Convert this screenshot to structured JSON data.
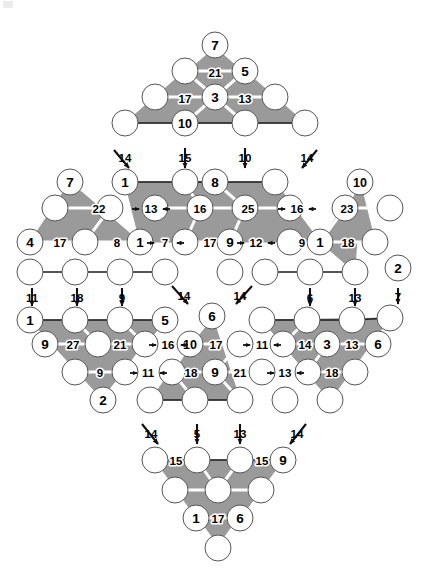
{
  "figure": {
    "colors": {
      "fill_shaded": "#9a9a9a",
      "fill_node": "#ffffff",
      "stroke": "#1a1a1a",
      "inner_edge": "#ffffff",
      "background": "#ffffff"
    },
    "geometry": {
      "cell_dx": 30,
      "cell_dy": 26,
      "node_radius": 13,
      "origin_x": 215,
      "origin_y": 45
    }
  },
  "chart_data": {
    "type": "diagram",
    "node_count": 66,
    "triangles": [
      {
        "name": "top-up",
        "apex_row": 0,
        "size": 4,
        "orientation": "up"
      },
      {
        "name": "left-up",
        "apex_row": 5,
        "size": 4,
        "orientation": "up"
      },
      {
        "name": "right-up",
        "apex_row": 5,
        "size": 4,
        "orientation": "up"
      },
      {
        "name": "center-down",
        "apex_row": 9,
        "size": 4,
        "orientation": "down"
      },
      {
        "name": "bottom-down",
        "apex_row": 16,
        "size": 4,
        "orientation": "down"
      }
    ]
  },
  "nodes": [
    {
      "id": "n-top-7",
      "label": "7",
      "x": 215,
      "y": 45
    },
    {
      "id": "n-r1-a",
      "label": "",
      "x": 185,
      "y": 71
    },
    {
      "id": "n-r1-5",
      "label": "5",
      "x": 245,
      "y": 71
    },
    {
      "id": "n-r2-a",
      "label": "",
      "x": 155,
      "y": 97
    },
    {
      "id": "n-r2-3",
      "label": "3",
      "x": 215,
      "y": 97
    },
    {
      "id": "n-r2-b",
      "label": "",
      "x": 275,
      "y": 97
    },
    {
      "id": "n-r3-a",
      "label": "",
      "x": 125,
      "y": 123
    },
    {
      "id": "n-r3-10",
      "label": "10",
      "x": 185,
      "y": 123
    },
    {
      "id": "n-r3-b",
      "label": "",
      "x": 245,
      "y": 123
    },
    {
      "id": "n-r3-c",
      "label": "",
      "x": 305,
      "y": 123
    },
    {
      "id": "n-r4-7",
      "label": "7",
      "x": 70,
      "y": 182
    },
    {
      "id": "n-r4-1",
      "label": "1",
      "x": 125,
      "y": 182
    },
    {
      "id": "n-r4-a",
      "label": "",
      "x": 185,
      "y": 182
    },
    {
      "id": "n-r4-8",
      "label": "8",
      "x": 215,
      "y": 182
    },
    {
      "id": "n-r4-b",
      "label": "",
      "x": 275,
      "y": 182
    },
    {
      "id": "n-r4-10",
      "label": "10",
      "x": 360,
      "y": 182
    },
    {
      "id": "n-r5-a",
      "label": "",
      "x": 55,
      "y": 208
    },
    {
      "id": "n-r5-b",
      "label": "",
      "x": 110,
      "y": 208
    },
    {
      "id": "n-r5-c",
      "label": "",
      "x": 155,
      "y": 208
    },
    {
      "id": "n-r5-d",
      "label": "",
      "x": 200,
      "y": 208
    },
    {
      "id": "n-r5-e",
      "label": "",
      "x": 245,
      "y": 208
    },
    {
      "id": "n-r5-f",
      "label": "",
      "x": 290,
      "y": 208
    },
    {
      "id": "n-r5-g",
      "label": "",
      "x": 345,
      "y": 208
    },
    {
      "id": "n-r5-h",
      "label": "",
      "x": 390,
      "y": 208
    },
    {
      "id": "n-r6-4",
      "label": "4",
      "x": 30,
      "y": 242
    },
    {
      "id": "n-r6-a",
      "label": "",
      "x": 85,
      "y": 242
    },
    {
      "id": "n-r6-1",
      "label": "1",
      "x": 140,
      "y": 242
    },
    {
      "id": "n-r6-b",
      "label": "",
      "x": 185,
      "y": 242
    },
    {
      "id": "n-r6-9",
      "label": "9",
      "x": 230,
      "y": 242
    },
    {
      "id": "n-r6-c",
      "label": "",
      "x": 290,
      "y": 242
    },
    {
      "id": "n-r6-1b",
      "label": "1",
      "x": 320,
      "y": 242
    },
    {
      "id": "n-r6-d",
      "label": "",
      "x": 375,
      "y": 242
    },
    {
      "id": "n-r7-a",
      "label": "",
      "x": 30,
      "y": 272
    },
    {
      "id": "n-r7-b",
      "label": "",
      "x": 75,
      "y": 272
    },
    {
      "id": "n-r7-c",
      "label": "",
      "x": 120,
      "y": 272
    },
    {
      "id": "n-r7-d",
      "label": "",
      "x": 165,
      "y": 272
    },
    {
      "id": "n-r7-e",
      "label": "",
      "x": 230,
      "y": 272
    },
    {
      "id": "n-r7-f",
      "label": "",
      "x": 265,
      "y": 272
    },
    {
      "id": "n-r7-g",
      "label": "",
      "x": 310,
      "y": 272
    },
    {
      "id": "n-r7-h",
      "label": "",
      "x": 355,
      "y": 272
    },
    {
      "id": "n-r7-2",
      "label": "2",
      "x": 398,
      "y": 268
    },
    {
      "id": "n-r8-1",
      "label": "1",
      "x": 30,
      "y": 320
    },
    {
      "id": "n-r8-a",
      "label": "",
      "x": 75,
      "y": 320
    },
    {
      "id": "n-r8-b",
      "label": "",
      "x": 120,
      "y": 320
    },
    {
      "id": "n-r8-5",
      "label": "5",
      "x": 165,
      "y": 320
    },
    {
      "id": "n-r8-6",
      "label": "6",
      "x": 212,
      "y": 316
    },
    {
      "id": "n-r8-c",
      "label": "",
      "x": 262,
      "y": 320
    },
    {
      "id": "n-r8-d",
      "label": "",
      "x": 307,
      "y": 320
    },
    {
      "id": "n-r8-e",
      "label": "",
      "x": 352,
      "y": 320
    },
    {
      "id": "n-r8-f",
      "label": "",
      "x": 390,
      "y": 318
    },
    {
      "id": "n-r9-9",
      "label": "9",
      "x": 45,
      "y": 344
    },
    {
      "id": "n-r9-a",
      "label": "",
      "x": 98,
      "y": 344
    },
    {
      "id": "n-r9-b",
      "label": "",
      "x": 145,
      "y": 344
    },
    {
      "id": "n-r9-10",
      "label": "10",
      "x": 190,
      "y": 344
    },
    {
      "id": "n-r9-c",
      "label": "",
      "x": 240,
      "y": 344
    },
    {
      "id": "n-r9-d",
      "label": "",
      "x": 283,
      "y": 344
    },
    {
      "id": "n-r9-3",
      "label": "3",
      "x": 327,
      "y": 344
    },
    {
      "id": "n-r9-6",
      "label": "6",
      "x": 378,
      "y": 344
    },
    {
      "id": "n-r10-a",
      "label": "",
      "x": 75,
      "y": 372
    },
    {
      "id": "n-r10-b",
      "label": "",
      "x": 125,
      "y": 372
    },
    {
      "id": "n-r10-c",
      "label": "",
      "x": 172,
      "y": 372
    },
    {
      "id": "n-r10-9",
      "label": "9",
      "x": 215,
      "y": 372
    },
    {
      "id": "n-r10-d",
      "label": "",
      "x": 262,
      "y": 372
    },
    {
      "id": "n-r10-e",
      "label": "",
      "x": 308,
      "y": 372
    },
    {
      "id": "n-r10-f",
      "label": "",
      "x": 355,
      "y": 372
    },
    {
      "id": "n-r11-2",
      "label": "2",
      "x": 103,
      "y": 400
    },
    {
      "id": "n-r11-a",
      "label": "",
      "x": 150,
      "y": 400
    },
    {
      "id": "n-r11-b",
      "label": "",
      "x": 195,
      "y": 400
    },
    {
      "id": "n-r11-c",
      "label": "",
      "x": 240,
      "y": 400
    },
    {
      "id": "n-r11-d",
      "label": "",
      "x": 285,
      "y": 400
    },
    {
      "id": "n-r11-e",
      "label": "",
      "x": 330,
      "y": 400
    },
    {
      "id": "n-r12-a",
      "label": "",
      "x": 155,
      "y": 460
    },
    {
      "id": "n-r12-b",
      "label": "",
      "x": 197,
      "y": 460
    },
    {
      "id": "n-r12-c",
      "label": "",
      "x": 240,
      "y": 460
    },
    {
      "id": "n-r12-9",
      "label": "9",
      "x": 283,
      "y": 460
    },
    {
      "id": "n-r13-a",
      "label": "",
      "x": 175,
      "y": 490
    },
    {
      "id": "n-r13-b",
      "label": "",
      "x": 218,
      "y": 490
    },
    {
      "id": "n-r13-c",
      "label": "",
      "x": 261,
      "y": 490
    },
    {
      "id": "n-r14-1",
      "label": "1",
      "x": 196,
      "y": 518
    },
    {
      "id": "n-r14-6",
      "label": "6",
      "x": 240,
      "y": 518
    },
    {
      "id": "n-r15-a",
      "label": "",
      "x": 218,
      "y": 548
    }
  ],
  "edge_labels": [
    {
      "id": "e-21",
      "text": "21",
      "x": 215,
      "y": 73
    },
    {
      "id": "e-17",
      "text": "17",
      "x": 185,
      "y": 99
    },
    {
      "id": "e-13",
      "text": "13",
      "x": 245,
      "y": 99
    },
    {
      "id": "e-22",
      "text": "22",
      "x": 99,
      "y": 209
    },
    {
      "id": "e-13b",
      "text": "13",
      "x": 151,
      "y": 209
    },
    {
      "id": "e-16",
      "text": "16",
      "x": 200,
      "y": 209
    },
    {
      "id": "e-25",
      "text": "25",
      "x": 248,
      "y": 209
    },
    {
      "id": "e-16b",
      "text": "16",
      "x": 297,
      "y": 209
    },
    {
      "id": "e-23",
      "text": "23",
      "x": 347,
      "y": 209
    },
    {
      "id": "e-17b",
      "text": "17",
      "x": 60,
      "y": 243
    },
    {
      "id": "e-8",
      "text": "8",
      "x": 117,
      "y": 243
    },
    {
      "id": "e-7",
      "text": "7",
      "x": 165,
      "y": 243
    },
    {
      "id": "e-17c",
      "text": "17",
      "x": 210,
      "y": 243
    },
    {
      "id": "e-12",
      "text": "12",
      "x": 256,
      "y": 243
    },
    {
      "id": "e-9",
      "text": "9",
      "x": 302,
      "y": 243
    },
    {
      "id": "e-18",
      "text": "18",
      "x": 348,
      "y": 243
    },
    {
      "id": "e-27",
      "text": "27",
      "x": 73,
      "y": 345
    },
    {
      "id": "e-21b",
      "text": "21",
      "x": 120,
      "y": 345
    },
    {
      "id": "e-16c",
      "text": "16",
      "x": 168,
      "y": 345
    },
    {
      "id": "e-17d",
      "text": "17",
      "x": 216,
      "y": 345
    },
    {
      "id": "e-11",
      "text": "11",
      "x": 262,
      "y": 345
    },
    {
      "id": "e-14",
      "text": "14",
      "x": 305,
      "y": 345
    },
    {
      "id": "e-13c",
      "text": "13",
      "x": 352,
      "y": 345
    },
    {
      "id": "e-9b",
      "text": "9",
      "x": 100,
      "y": 373
    },
    {
      "id": "e-11b",
      "text": "11",
      "x": 148,
      "y": 373
    },
    {
      "id": "e-18b",
      "text": "18",
      "x": 191,
      "y": 373
    },
    {
      "id": "e-21c",
      "text": "21",
      "x": 240,
      "y": 373
    },
    {
      "id": "e-13d",
      "text": "13",
      "x": 285,
      "y": 373
    },
    {
      "id": "e-18c",
      "text": "18",
      "x": 332,
      "y": 373
    },
    {
      "id": "e-15",
      "text": "15",
      "x": 176,
      "y": 461
    },
    {
      "id": "e-15b",
      "text": "15",
      "x": 262,
      "y": 461
    },
    {
      "id": "e-17e",
      "text": "17",
      "x": 218,
      "y": 519
    }
  ],
  "external_labels": [
    {
      "id": "x-14a",
      "text": "14",
      "x": 125,
      "y": 158
    },
    {
      "id": "x-15a",
      "text": "15",
      "x": 185,
      "y": 158
    },
    {
      "id": "x-10a",
      "text": "10",
      "x": 245,
      "y": 158
    },
    {
      "id": "x-14b",
      "text": "14",
      "x": 307,
      "y": 158
    },
    {
      "id": "x-11a",
      "text": "11",
      "x": 32,
      "y": 298
    },
    {
      "id": "x-18a",
      "text": "18",
      "x": 77,
      "y": 298
    },
    {
      "id": "x-9a",
      "text": "9",
      "x": 122,
      "y": 298
    },
    {
      "id": "x-14c",
      "text": "14",
      "x": 184,
      "y": 296
    },
    {
      "id": "x-14d",
      "text": "14",
      "x": 240,
      "y": 296
    },
    {
      "id": "x-6a",
      "text": "6",
      "x": 310,
      "y": 298
    },
    {
      "id": "x-13a",
      "text": "13",
      "x": 355,
      "y": 298
    },
    {
      "id": "x-7a",
      "text": "7",
      "x": 398,
      "y": 297
    },
    {
      "id": "x-14e",
      "text": "14",
      "x": 151,
      "y": 434
    },
    {
      "id": "x-5a",
      "text": "5",
      "x": 197,
      "y": 434
    },
    {
      "id": "x-13b",
      "text": "13",
      "x": 240,
      "y": 434
    },
    {
      "id": "x-14f",
      "text": "14",
      "x": 297,
      "y": 434
    }
  ],
  "arrows": [
    {
      "id": "a-1",
      "x1": 114,
      "y1": 150,
      "x2": 129,
      "y2": 168,
      "dir": "down-right"
    },
    {
      "id": "a-2",
      "x1": 185,
      "y1": 148,
      "x2": 185,
      "y2": 168,
      "dir": "down"
    },
    {
      "id": "a-3",
      "x1": 245,
      "y1": 148,
      "x2": 245,
      "y2": 168,
      "dir": "down"
    },
    {
      "id": "a-4",
      "x1": 317,
      "y1": 150,
      "x2": 302,
      "y2": 168,
      "dir": "down-left"
    },
    {
      "id": "a-5",
      "x1": 32,
      "y1": 288,
      "x2": 32,
      "y2": 306,
      "dir": "down"
    },
    {
      "id": "a-6",
      "x1": 77,
      "y1": 288,
      "x2": 77,
      "y2": 306,
      "dir": "down"
    },
    {
      "id": "a-7",
      "x1": 122,
      "y1": 288,
      "x2": 122,
      "y2": 306,
      "dir": "down"
    },
    {
      "id": "a-8",
      "x1": 172,
      "y1": 286,
      "x2": 188,
      "y2": 304,
      "dir": "down-right"
    },
    {
      "id": "a-9",
      "x1": 252,
      "y1": 286,
      "x2": 236,
      "y2": 304,
      "dir": "down-left"
    },
    {
      "id": "a-10",
      "x1": 310,
      "y1": 288,
      "x2": 310,
      "y2": 306,
      "dir": "down"
    },
    {
      "id": "a-11",
      "x1": 355,
      "y1": 288,
      "x2": 355,
      "y2": 306,
      "dir": "down"
    },
    {
      "id": "a-12",
      "x1": 398,
      "y1": 288,
      "x2": 398,
      "y2": 304,
      "dir": "down"
    },
    {
      "id": "a-13",
      "x1": 142,
      "y1": 424,
      "x2": 158,
      "y2": 444,
      "dir": "down-right"
    },
    {
      "id": "a-14",
      "x1": 197,
      "y1": 424,
      "x2": 197,
      "y2": 444,
      "dir": "down"
    },
    {
      "id": "a-15",
      "x1": 240,
      "y1": 424,
      "x2": 240,
      "y2": 444,
      "dir": "down"
    },
    {
      "id": "a-16",
      "x1": 306,
      "y1": 424,
      "x2": 290,
      "y2": 444,
      "dir": "down-left"
    }
  ]
}
